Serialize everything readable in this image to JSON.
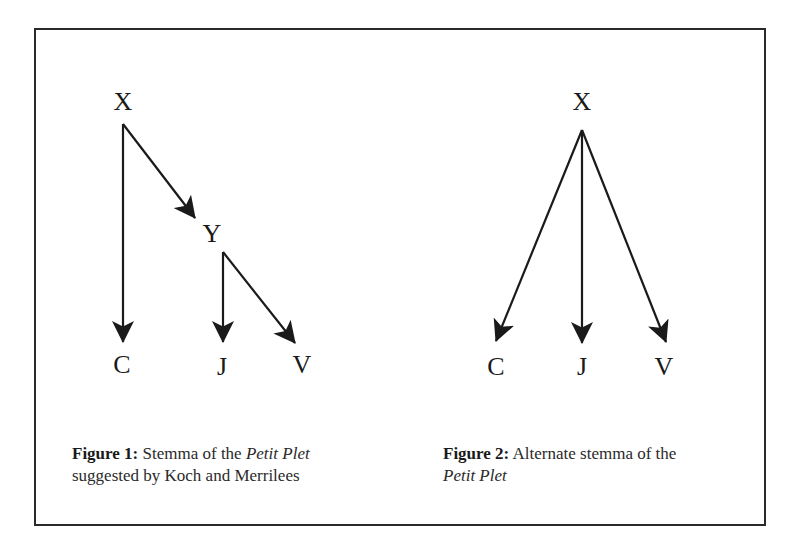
{
  "figure1": {
    "nodes": {
      "X": "X",
      "Y": "Y",
      "C": "C",
      "J": "J",
      "V": "V"
    },
    "edges": [
      {
        "from": "X",
        "to": "C"
      },
      {
        "from": "X",
        "to": "Y"
      },
      {
        "from": "Y",
        "to": "J"
      },
      {
        "from": "Y",
        "to": "V"
      }
    ],
    "caption": {
      "label": "Figure 1:",
      "text_before": " Stemma of the ",
      "italic": "Petit Plet",
      "text_after": "suggested by Koch and Merrilees"
    }
  },
  "figure2": {
    "nodes": {
      "X": "X",
      "C": "C",
      "J": "J",
      "V": "V"
    },
    "edges": [
      {
        "from": "X",
        "to": "C"
      },
      {
        "from": "X",
        "to": "J"
      },
      {
        "from": "X",
        "to": "V"
      }
    ],
    "caption": {
      "label": "Figure 2:",
      "text_before": " Alternate stemma of the",
      "italic": "Petit Plet"
    }
  }
}
